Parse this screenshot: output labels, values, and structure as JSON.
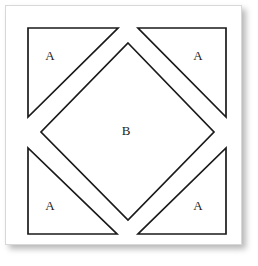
{
  "figure": {
    "canvas": {
      "width": 258,
      "height": 266
    },
    "card": {
      "x": 5,
      "y": 5,
      "width": 237,
      "height": 240,
      "background": "#ffffff",
      "border_color": "#d8d8d8",
      "shadow_color": "rgba(0,0,0,0.28)"
    },
    "style": {
      "stroke_color": "#1a1a1a",
      "stroke_width": 1.7,
      "fill_color": "#ffffff",
      "label_color": "#222222",
      "label_font_size": 13
    }
  },
  "pieces": [
    {
      "id": "triangle-top-left",
      "label": "A",
      "shape": "right-triangle",
      "points": "28,28 118,28 28,117",
      "label_x": 50,
      "label_y": 57
    },
    {
      "id": "triangle-top-right",
      "label": "A",
      "shape": "right-triangle",
      "points": "138,28 226,28 226,117",
      "label_x": 198,
      "label_y": 57
    },
    {
      "id": "triangle-bottom-left",
      "label": "A",
      "shape": "right-triangle",
      "points": "28,148 28,234 117,234",
      "label_x": 50,
      "label_y": 207
    },
    {
      "id": "triangle-bottom-right",
      "label": "A",
      "shape": "right-triangle",
      "points": "138,234 226,234 226,148",
      "label_x": 198,
      "label_y": 207
    },
    {
      "id": "diamond-center",
      "label": "B",
      "shape": "square-on-point",
      "points": "128,43 214,132 128,220 41,132",
      "label_x": 126,
      "label_y": 132
    }
  ],
  "legend": {
    "a_label": "A",
    "b_label": "B",
    "a_count": 4,
    "b_count": 1
  }
}
